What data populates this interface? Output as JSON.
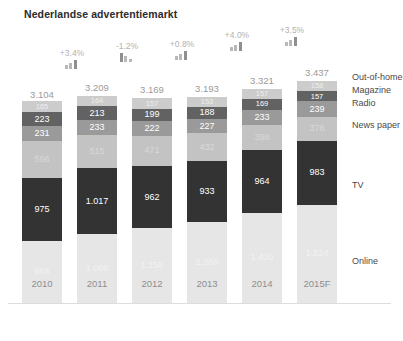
{
  "title": "Nederlandse advertentiemarkt",
  "legend": {
    "position": "right",
    "items": [
      {
        "key": "out_of_home",
        "label": "Out-of-home",
        "color": "#cccccc"
      },
      {
        "key": "magazine",
        "label": "Magazine",
        "color": "#626262"
      },
      {
        "key": "radio",
        "label": "Radio",
        "color": "#9a9a9a"
      },
      {
        "key": "newspaper",
        "label": "News paper",
        "color": "#c3c3c3"
      },
      {
        "key": "tv",
        "label": "TV",
        "color": "#333333"
      },
      {
        "key": "online",
        "label": "Online",
        "color": "#e6e6e6"
      }
    ]
  },
  "chart_data": {
    "type": "bar",
    "subtype": "stacked-bar",
    "title": "Nederlandse advertentiemarkt",
    "xlabel": "",
    "ylabel": "",
    "grid": false,
    "legend_position": "right",
    "categories": [
      "2010",
      "2011",
      "2012",
      "2013",
      "2014",
      "2015F"
    ],
    "totals": [
      "3.104",
      "3.209",
      "3.169",
      "3.193",
      "3.321",
      "3.437"
    ],
    "totals_numeric": [
      3104,
      3209,
      3169,
      3193,
      3321,
      3437
    ],
    "growth_labels": [
      "+3.4%",
      "-1.2%",
      "+0.8%",
      "+4.0%",
      "+3.5%"
    ],
    "growth_between": [
      "2010-2011",
      "2011-2012",
      "2012-2013",
      "2013-2014",
      "2014-2015F"
    ],
    "growth_direction": [
      "up",
      "down",
      "up",
      "up",
      "up"
    ],
    "series": [
      {
        "name": "Out-of-home",
        "color": "#cccccc",
        "values": [
          165,
          164,
          157,
          153,
          157,
          158
        ],
        "labels": [
          "165",
          "164",
          "157",
          "153",
          "157",
          "158"
        ]
      },
      {
        "name": "Magazine",
        "color": "#626262",
        "values": [
          223,
          213,
          199,
          188,
          169,
          157
        ],
        "labels": [
          "223",
          "213",
          "199",
          "188",
          "169",
          "157"
        ]
      },
      {
        "name": "Radio",
        "color": "#9a9a9a",
        "values": [
          231,
          233,
          222,
          227,
          233,
          239
        ],
        "labels": [
          "231",
          "233",
          "222",
          "227",
          "233",
          "239"
        ]
      },
      {
        "name": "News paper",
        "color": "#c3c3c3",
        "values": [
          566,
          515,
          471,
          432,
          398,
          376
        ],
        "labels": [
          "566",
          "515",
          "471",
          "432",
          "398",
          "376"
        ]
      },
      {
        "name": "TV",
        "color": "#333333",
        "values": [
          975,
          1017,
          962,
          933,
          964,
          983
        ],
        "labels": [
          "975",
          "1.017",
          "962",
          "933",
          "964",
          "983"
        ]
      },
      {
        "name": "Online",
        "color": "#e6e6e6",
        "values": [
          964,
          1068,
          1158,
          1260,
          1400,
          1524
        ],
        "labels": [
          "964",
          "1.068",
          "1.158",
          "1.260",
          "1.400",
          "1.524"
        ]
      }
    ]
  }
}
